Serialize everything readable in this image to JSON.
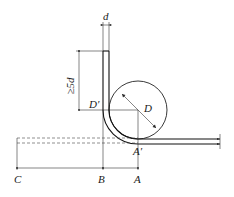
{
  "diagram": {
    "labels": {
      "d": "d",
      "min_length": "≥5d",
      "D_prime": "D′",
      "D": "D",
      "A_prime": "A′",
      "A": "A",
      "B": "B",
      "C": "C"
    },
    "colors": {
      "line": "#222222",
      "background": "#ffffff"
    }
  }
}
